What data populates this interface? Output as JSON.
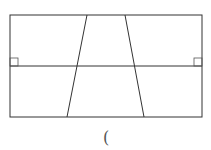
{
  "diagram": {
    "stroke_color": "#333333",
    "stroke_width": 1,
    "rectangle": {
      "x1": 10,
      "y1": 15,
      "x2": 202,
      "y2": 117
    },
    "midline": {
      "y": 66
    },
    "slanted_lines": [
      {
        "name": "left",
        "x_top": 87,
        "y_top": 15,
        "x_bottom": 67,
        "y_bottom": 117
      },
      {
        "name": "right",
        "x_top": 125,
        "y_top": 15,
        "x_bottom": 144,
        "y_bottom": 117
      }
    ],
    "right_angle_marks": [
      {
        "name": "left",
        "x": 10,
        "y": 58,
        "size": 8
      },
      {
        "name": "right",
        "x": 194,
        "y": 58,
        "size": 8
      }
    ]
  },
  "caption": {
    "text": "("
  }
}
